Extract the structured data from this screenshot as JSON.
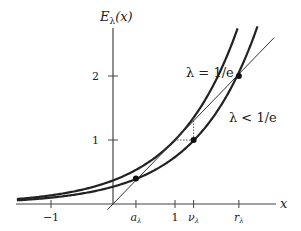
{
  "chart_data": {
    "type": "line",
    "title": "",
    "ylabel": "E_λ(x)",
    "ylabel_main": "E",
    "ylabel_sub": "λ",
    "ylabel_arg": "(x)",
    "xlabel": "x",
    "xlim": [
      -1.55,
      2.7
    ],
    "ylim": [
      0,
      2.6
    ],
    "grid": false,
    "x_ticks": [
      {
        "value": -1,
        "label": "−1"
      },
      {
        "value": 0.37,
        "label": "a",
        "sub": "λ"
      },
      {
        "value": 1,
        "label": "1"
      },
      {
        "value": 1.3,
        "label": "ν",
        "sub": "λ"
      },
      {
        "value": 2.03,
        "label": "r",
        "sub": "λ"
      }
    ],
    "y_ticks": [
      {
        "value": 1,
        "label": "1"
      },
      {
        "value": 2,
        "label": "2"
      }
    ],
    "series": [
      {
        "name": "λ = 1/e",
        "function": "exp(x - 1)",
        "lambda": 0.3679
      },
      {
        "name": "λ < 1/e",
        "function": "λ·exp(x)",
        "lambda": 0.27
      },
      {
        "name": "y = x",
        "function": "x",
        "lambda": null
      }
    ],
    "points": [
      {
        "name": "a_λ",
        "x": 0.37,
        "y": 0.4
      },
      {
        "name": "ν_λ",
        "x": 1.3,
        "y": 1.0
      },
      {
        "name": "r_λ",
        "x": 2.03,
        "y": 2.0
      }
    ],
    "annotations": [
      {
        "text": "λ = 1/e"
      },
      {
        "text": "λ < 1/e"
      }
    ]
  }
}
